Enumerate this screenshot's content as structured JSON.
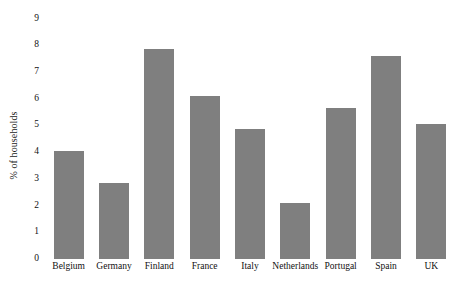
{
  "chart_data": {
    "type": "bar",
    "title": "",
    "subtitle": "",
    "xlabel": "",
    "ylabel": "% of households",
    "ylim": [
      0,
      9
    ],
    "yticks": [
      0,
      1,
      2,
      3,
      4,
      5,
      6,
      7,
      8,
      9
    ],
    "ytick_labels": [
      "0",
      "1",
      "2",
      "3",
      "4",
      "5",
      "6",
      "7",
      "8",
      "9"
    ],
    "grid": false,
    "legend": false,
    "legend_position": "none",
    "bar_color": "#7f7f7f",
    "background_color": "#ffffff",
    "categories": [
      "Belgium",
      "Germany",
      "Finland",
      "France",
      "Italy",
      "Netherlands",
      "Portugal",
      "Spain",
      "UK"
    ],
    "values": [
      4.05,
      2.85,
      7.85,
      6.1,
      4.85,
      2.1,
      5.65,
      7.6,
      5.05
    ]
  }
}
